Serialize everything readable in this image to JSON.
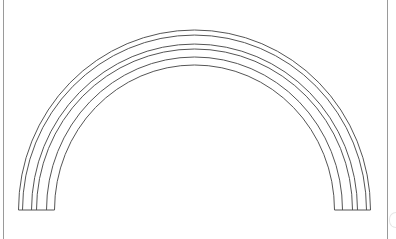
{
  "artwork": {
    "subject": "rainbow",
    "band_count": 5,
    "arc_line_count": 6,
    "stroke_color": "#555555",
    "background_color": "#ffffff",
    "border_color": "#9a9a9a"
  },
  "watermark": {
    "icon": "faint-logo-icon"
  }
}
